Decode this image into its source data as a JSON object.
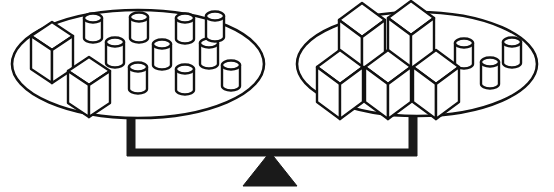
{
  "figure": {
    "type": "balance-scale-illustration",
    "title": "Balance scale with two pans",
    "state": "level",
    "line_color": "#111111",
    "fill_color": "#ffffff",
    "solid_color": "#1a1a1a",
    "background_color": "#ffffff",
    "canvas": {
      "width": 554,
      "height": 192
    }
  },
  "left_pan": {
    "label": "Left pan",
    "ellipse": {
      "cx": 138,
      "cy": 64,
      "rx": 126,
      "ry": 54
    },
    "counts": {
      "cubes": 2,
      "cylinders": 10,
      "total": 12
    },
    "cubes": [
      {
        "name": "cube-l1",
        "x": 38,
        "y": 28,
        "size": 30
      },
      {
        "name": "cube-l2",
        "x": 66,
        "y": 60,
        "size": 30
      }
    ],
    "cylinders": [
      {
        "name": "cyl-l1",
        "x": 84,
        "y": 10,
        "w": 17,
        "h": 30
      },
      {
        "name": "cyl-l2",
        "x": 130,
        "y": 9,
        "w": 17,
        "h": 31
      },
      {
        "name": "cyl-l3",
        "x": 176,
        "y": 11,
        "w": 18,
        "h": 31
      },
      {
        "name": "cyl-l4",
        "x": 106,
        "y": 34,
        "w": 17,
        "h": 31
      },
      {
        "name": "cyl-l5",
        "x": 153,
        "y": 36,
        "w": 17,
        "h": 31
      },
      {
        "name": "cyl-l6",
        "x": 200,
        "y": 35,
        "w": 17,
        "h": 31
      },
      {
        "name": "cyl-l7",
        "x": 129,
        "y": 59,
        "w": 18,
        "h": 32
      },
      {
        "name": "cyl-l8",
        "x": 176,
        "y": 61,
        "w": 17,
        "h": 31
      },
      {
        "name": "cyl-l9",
        "x": 222,
        "y": 57,
        "w": 17,
        "h": 30
      },
      {
        "name": "cyl-l10",
        "x": 212,
        "y": 10,
        "w": 0,
        "h": 0
      }
    ]
  },
  "right_pan": {
    "label": "Right pan",
    "ellipse": {
      "cx": 417,
      "cy": 64,
      "rx": 120,
      "ry": 52
    },
    "counts": {
      "cubes": 5,
      "cylinders": 3,
      "total": 8
    },
    "cubes": [
      {
        "name": "cube-r1",
        "x": 339,
        "y": 3,
        "size": 33
      },
      {
        "name": "cube-r2",
        "x": 388,
        "y": 1,
        "size": 33
      },
      {
        "name": "cube-r3",
        "x": 317,
        "y": 50,
        "size": 33
      },
      {
        "name": "cube-r4",
        "x": 361,
        "y": 50,
        "size": 33
      },
      {
        "name": "cube-r5",
        "x": 412,
        "y": 50,
        "size": 33
      }
    ],
    "cylinders": [
      {
        "name": "cyl-r1",
        "x": 455,
        "y": 35,
        "w": 17,
        "h": 31
      },
      {
        "name": "cyl-r2",
        "x": 481,
        "y": 54,
        "w": 17,
        "h": 31
      },
      {
        "name": "cyl-r3",
        "x": 503,
        "y": 34,
        "w": 17,
        "h": 31
      }
    ]
  },
  "beam": {
    "label": "Balance beam",
    "left_post_x": 131,
    "right_post_x": 413,
    "top_y": 116,
    "bottom_y": 155,
    "thickness": 7
  },
  "fulcrum": {
    "label": "Fulcrum",
    "shape": "triangle",
    "apex": {
      "x": 270,
      "y": 152
    },
    "left": {
      "x": 243,
      "y": 186
    },
    "right": {
      "x": 297,
      "y": 186
    }
  }
}
